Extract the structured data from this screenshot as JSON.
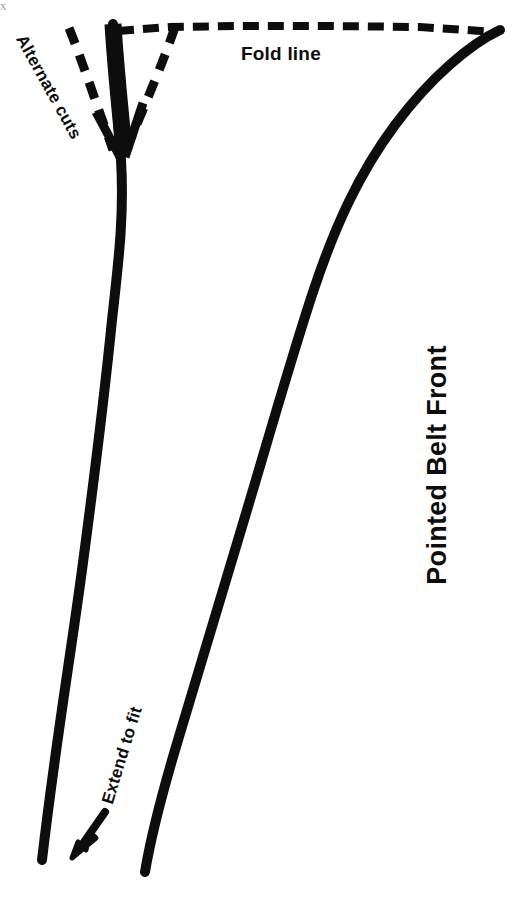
{
  "document": {
    "kind": "sewing-pattern-diagram",
    "title": "Pointed Belt Front",
    "background_color": "#ffffff",
    "ink_color": "#0d0d0d"
  },
  "labels": {
    "fold_line": "Fold line",
    "pointed_belt_front": "Pointed Belt Front",
    "alternate_cuts": "Alternate cuts",
    "extend_to_fit": "Extend to fit",
    "corner_mark": "X"
  },
  "geometry": {
    "fold_line": {
      "style": "dashed",
      "description": "horizontal dashed fold line across the top of the sheet",
      "dash_length": 15,
      "dash_gap": 8,
      "stroke_width": 7
    },
    "left_edge": {
      "style": "solid",
      "description": "near-vertical hand drawn belt edge descending from the fold line to the lower left",
      "stroke_width": 9
    },
    "right_edge": {
      "style": "solid",
      "description": "long curved belt edge sweeping from the top right corner down to the bottom centre",
      "stroke_width": 9
    },
    "alternate_cut_lines": {
      "style": "dashed",
      "count": 2,
      "description": "two dashed diagonal cut guides forming a V that converges on the point"
    },
    "solid_cut_lines": {
      "style": "solid",
      "count": 2,
      "description": "two short solid diagonals converging into the belt point"
    },
    "extend_arrow": {
      "style": "solid-arrow",
      "direction": "down-left",
      "description": "arrow indicating the belt may be lengthened"
    }
  }
}
